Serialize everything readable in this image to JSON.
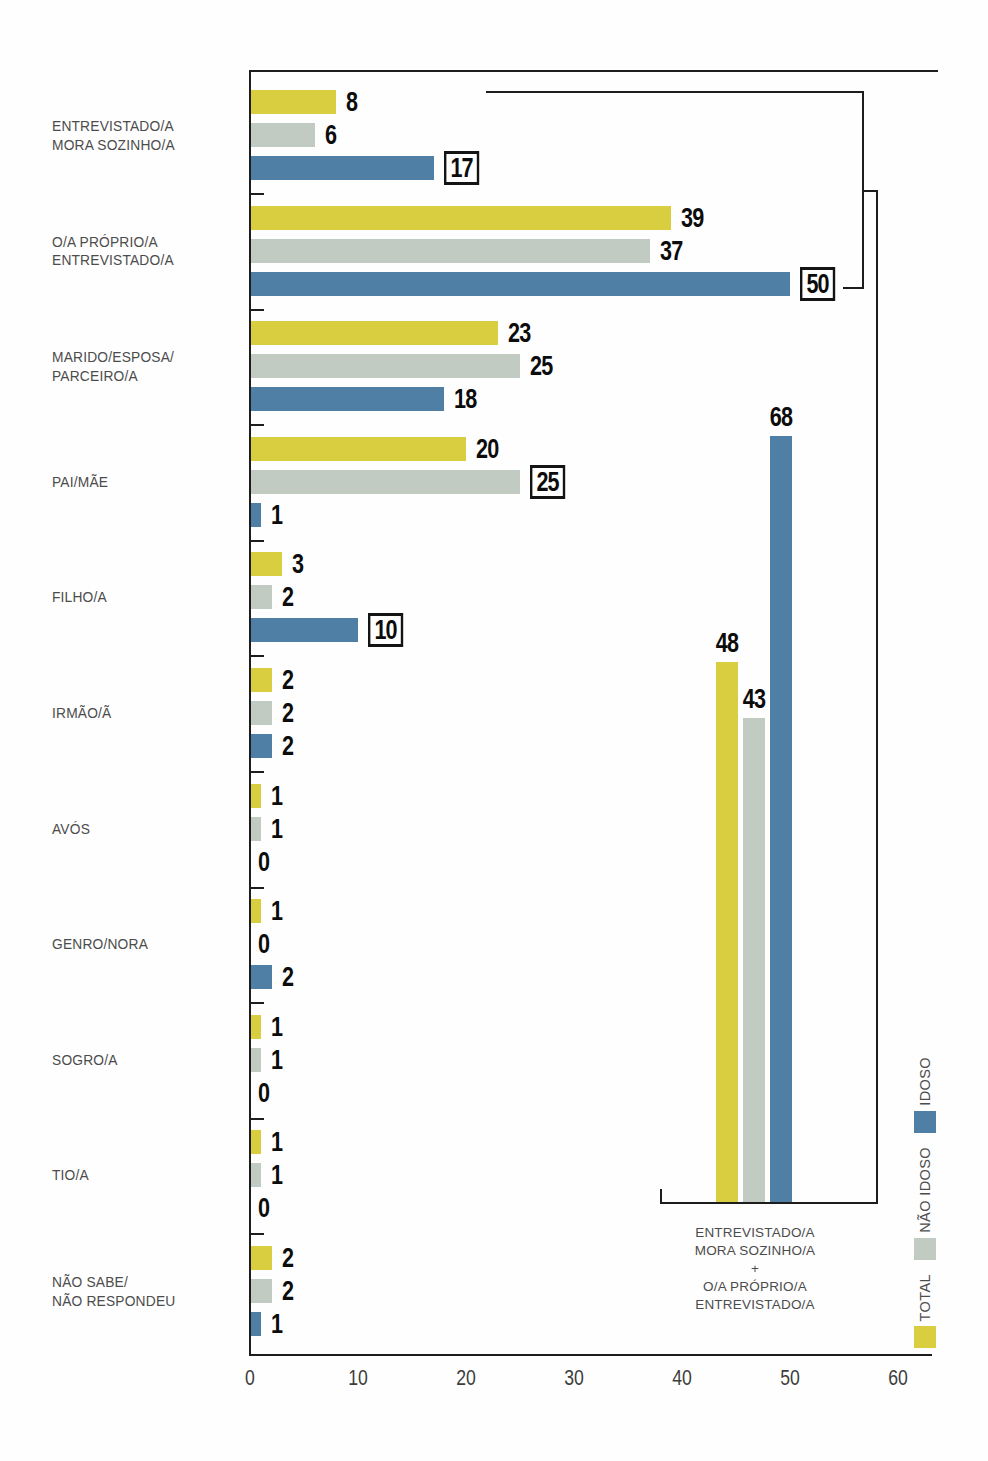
{
  "chart_data": {
    "type": "bar",
    "orientation": "horizontal",
    "grid": false,
    "series_names": [
      "TOTAL",
      "NÃO IDOSO",
      "IDOSO"
    ],
    "series_colors": {
      "TOTAL": "#d9cd40",
      "NÃO IDOSO": "#c2cbc2",
      "IDOSO": "#4f7fa4"
    },
    "categories": [
      {
        "label_lines": [
          "ENTREVISTADO/A",
          "MORA SOZINHO/A"
        ],
        "values": [
          8,
          6,
          17
        ],
        "boxed": [
          false,
          false,
          true
        ]
      },
      {
        "label_lines": [
          "O/A PRÓPRIO/A",
          "ENTREVISTADO/A"
        ],
        "values": [
          39,
          37,
          50
        ],
        "boxed": [
          false,
          false,
          true
        ]
      },
      {
        "label_lines": [
          "MARIDO/ESPOSA/",
          "PARCEIRO/A"
        ],
        "values": [
          23,
          25,
          18
        ],
        "boxed": [
          false,
          false,
          false
        ]
      },
      {
        "label_lines": [
          "PAI/MÃE"
        ],
        "values": [
          20,
          25,
          1
        ],
        "boxed": [
          false,
          true,
          false
        ]
      },
      {
        "label_lines": [
          "FILHO/A"
        ],
        "values": [
          3,
          2,
          10
        ],
        "boxed": [
          false,
          false,
          true
        ]
      },
      {
        "label_lines": [
          "IRMÃO/Ã"
        ],
        "values": [
          2,
          2,
          2
        ],
        "boxed": [
          false,
          false,
          false
        ]
      },
      {
        "label_lines": [
          "AVÓS"
        ],
        "values": [
          1,
          1,
          0
        ],
        "boxed": [
          false,
          false,
          false
        ]
      },
      {
        "label_lines": [
          "GENRO/NORA"
        ],
        "values": [
          1,
          0,
          2
        ],
        "boxed": [
          false,
          false,
          false
        ]
      },
      {
        "label_lines": [
          "SOGRO/A"
        ],
        "values": [
          1,
          1,
          0
        ],
        "boxed": [
          false,
          false,
          false
        ]
      },
      {
        "label_lines": [
          "TIO/A"
        ],
        "values": [
          1,
          1,
          0
        ],
        "boxed": [
          false,
          false,
          false
        ]
      },
      {
        "label_lines": [
          "NÃO SABE/",
          "NÃO RESPONDEU"
        ],
        "values": [
          2,
          2,
          1
        ],
        "boxed": [
          false,
          false,
          false
        ]
      }
    ],
    "x_axis": {
      "ticks": [
        0,
        10,
        20,
        30,
        40,
        50,
        60
      ],
      "min": 0,
      "max": 60
    },
    "inset": {
      "caption_lines": [
        "ENTREVISTADO/A",
        "MORA SOZINHO/A",
        "+",
        "O/A PRÓPRIO/A",
        "ENTREVISTADO/A"
      ],
      "values": [
        48,
        43,
        68
      ],
      "boxed": [
        false,
        false,
        false
      ]
    },
    "legend": [
      {
        "label": "IDOSO",
        "color": "#4f7fa4"
      },
      {
        "label": "NÃO IDOSO",
        "color": "#c2cbc2"
      },
      {
        "label": "TOTAL",
        "color": "#d9cd40"
      }
    ]
  }
}
